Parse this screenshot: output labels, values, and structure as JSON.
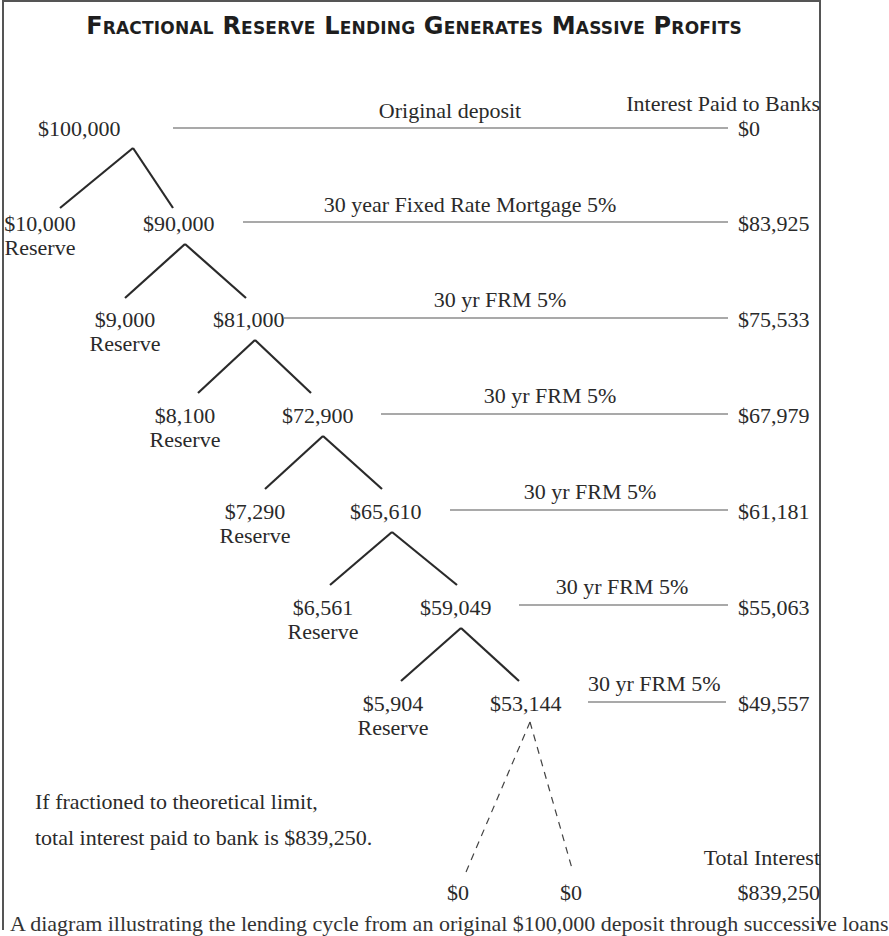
{
  "title": "Fractional Reserve Lending Generates Massive Profits",
  "column_header": "Interest Paid to Banks",
  "rows": [
    {
      "amount": "$100,000",
      "reserve": null,
      "reserve_label": null,
      "loan_label": "Original deposit",
      "interest": "$0"
    },
    {
      "amount": "$90,000",
      "reserve": "$10,000",
      "reserve_label": "Reserve",
      "loan_label": "30 year Fixed Rate Mortgage 5%",
      "interest": "$83,925"
    },
    {
      "amount": "$81,000",
      "reserve": "$9,000",
      "reserve_label": "Reserve",
      "loan_label": "30 yr FRM 5%",
      "interest": "$75,533"
    },
    {
      "amount": "$72,900",
      "reserve": "$8,100",
      "reserve_label": "Reserve",
      "loan_label": "30 yr FRM 5%",
      "interest": "$67,979"
    },
    {
      "amount": "$65,610",
      "reserve": "$7,290",
      "reserve_label": "Reserve",
      "loan_label": "30 yr FRM 5%",
      "interest": "$61,181"
    },
    {
      "amount": "$59,049",
      "reserve": "$6,561",
      "reserve_label": "Reserve",
      "loan_label": "30 yr FRM 5%",
      "interest": "$55,063"
    },
    {
      "amount": "$53,144",
      "reserve": "$5,904",
      "reserve_label": "Reserve",
      "loan_label": "30 yr FRM 5%",
      "interest": "$49,557"
    }
  ],
  "limit_leaves": [
    "$0",
    "$0"
  ],
  "note": {
    "line1": "If fractioned to theoretical limit,",
    "line2": "total interest paid to bank is $839,250."
  },
  "total": {
    "label": "Total Interest",
    "value": "$839,250"
  },
  "caption_partial": "A diagram illustrating the lending cycle from an original $100,000 deposit through successive loans"
}
